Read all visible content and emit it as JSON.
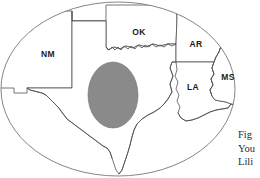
{
  "figure": {
    "type": "map",
    "background_color": "#ffffff",
    "frame": {
      "shape": "ellipse",
      "stroke_color": "#777777",
      "fill_color": "#ffffff"
    },
    "border_color": "#4a4a4a",
    "highlight": {
      "shape": "ellipse",
      "fill_color": "#8a8a8a",
      "stroke_color": "#6f6f6f",
      "location": "central Texas"
    }
  },
  "state_labels": [
    {
      "abbr": "NM",
      "x": 48,
      "y": 55
    },
    {
      "abbr": "OK",
      "x": 139,
      "y": 33
    },
    {
      "abbr": "AR",
      "x": 196,
      "y": 45
    },
    {
      "abbr": "LA",
      "x": 193,
      "y": 88
    },
    {
      "abbr": "MS",
      "x": 228,
      "y": 78
    }
  ],
  "caption": {
    "lines": [
      "Fig",
      "You",
      "Lili"
    ],
    "clipped": true
  }
}
